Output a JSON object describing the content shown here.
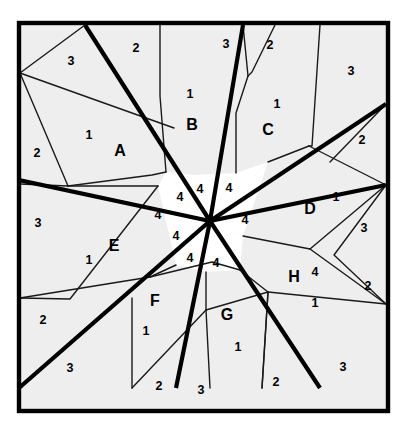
{
  "figure": {
    "frame": {
      "x": 19,
      "y": 23,
      "width": 369,
      "height": 388
    },
    "center": {
      "x": 210,
      "y": 221
    },
    "colors": {
      "shaded_region": "#eeeeee",
      "white_region": "#ffffff",
      "thin_stroke": "#1a1a1a",
      "thick_stroke": "#000000",
      "background": "#ffffff",
      "label_text": "#000000"
    }
  },
  "region_labels": [
    {
      "id": "A",
      "text": "A",
      "x": 120,
      "y": 150
    },
    {
      "id": "B",
      "text": "B",
      "x": 192,
      "y": 124
    },
    {
      "id": "C",
      "text": "C",
      "x": 268,
      "y": 129
    },
    {
      "id": "D",
      "text": "D",
      "x": 310,
      "y": 208
    },
    {
      "id": "E",
      "text": "E",
      "x": 114,
      "y": 245
    },
    {
      "id": "F",
      "text": "F",
      "x": 155,
      "y": 300
    },
    {
      "id": "G",
      "text": "G",
      "x": 227,
      "y": 314
    },
    {
      "id": "H",
      "text": "H",
      "x": 294,
      "y": 276
    }
  ],
  "number_labels": [
    {
      "text": "3",
      "x": 71,
      "y": 61
    },
    {
      "text": "2",
      "x": 136,
      "y": 48
    },
    {
      "text": "3",
      "x": 226,
      "y": 44
    },
    {
      "text": "2",
      "x": 270,
      "y": 45
    },
    {
      "text": "3",
      "x": 351,
      "y": 71
    },
    {
      "text": "1",
      "x": 190,
      "y": 94
    },
    {
      "text": "1",
      "x": 277,
      "y": 104
    },
    {
      "text": "1",
      "x": 89,
      "y": 135
    },
    {
      "text": "2",
      "x": 37,
      "y": 153
    },
    {
      "text": "2",
      "x": 362,
      "y": 140
    },
    {
      "text": "3",
      "x": 38,
      "y": 223
    },
    {
      "text": "1",
      "x": 336,
      "y": 197
    },
    {
      "text": "3",
      "x": 364,
      "y": 228
    },
    {
      "text": "1",
      "x": 89,
      "y": 260
    },
    {
      "text": "4",
      "x": 315,
      "y": 272
    },
    {
      "text": "2",
      "x": 368,
      "y": 286
    },
    {
      "text": "1",
      "x": 315,
      "y": 303
    },
    {
      "text": "2",
      "x": 43,
      "y": 320
    },
    {
      "text": "1",
      "x": 146,
      "y": 331
    },
    {
      "text": "1",
      "x": 238,
      "y": 347
    },
    {
      "text": "3",
      "x": 70,
      "y": 368
    },
    {
      "text": "2",
      "x": 159,
      "y": 386
    },
    {
      "text": "3",
      "x": 201,
      "y": 390
    },
    {
      "text": "2",
      "x": 276,
      "y": 382
    },
    {
      "text": "3",
      "x": 343,
      "y": 367
    },
    {
      "text": "4",
      "x": 180,
      "y": 197
    },
    {
      "text": "4",
      "x": 200,
      "y": 189
    },
    {
      "text": "4",
      "x": 229,
      "y": 188
    },
    {
      "text": "4",
      "x": 245,
      "y": 220
    },
    {
      "text": "4",
      "x": 176,
      "y": 236
    },
    {
      "text": "4",
      "x": 190,
      "y": 258
    },
    {
      "text": "4",
      "x": 216,
      "y": 263
    },
    {
      "text": "4",
      "x": 158,
      "y": 215
    }
  ],
  "shaded_regions": [
    {
      "name": "top-left-corner-3",
      "points": "21,25 85,25 20,73"
    },
    {
      "name": "region-A-outer-1",
      "points": "20,73 174,128 152,175 68,186"
    },
    {
      "name": "region-A-left-2",
      "points": "20,73 68,186 20,184"
    },
    {
      "name": "region-B",
      "points": "160,25 243,25 236,113 194,175 166,172"
    },
    {
      "name": "top-2-strip",
      "points": "85,25 160,25 160,96"
    },
    {
      "name": "top-3-wedge",
      "points": "243,25 275,25 248,76"
    },
    {
      "name": "region-C",
      "points": "248,76 300,25 320,25 309,146 268,162"
    },
    {
      "name": "region-C-top-2",
      "points": "275,25 300,25 252,72"
    },
    {
      "name": "top-right-3",
      "points": "320,25 386,25 386,104 312,146"
    },
    {
      "name": "region-D",
      "points": "309,146 386,104 386,185 310,249 243,236"
    },
    {
      "name": "right-2",
      "points": "386,104 386,185 330,162"
    },
    {
      "name": "region-E",
      "points": "20,184 68,186 158,186 188,242 150,277 70,299"
    },
    {
      "name": "left-3",
      "points": "20,184 70,299 20,298"
    },
    {
      "name": "left-2-lower",
      "points": "20,298 70,299 20,388"
    },
    {
      "name": "bottom-left-3",
      "points": "20,388 75,388 132,388 132,330"
    },
    {
      "name": "region-F",
      "points": "150,277 212,262 206,310 176,388 132,388 132,298"
    },
    {
      "name": "bottom-2",
      "points": "132,330 132,388 176,388"
    },
    {
      "name": "region-G",
      "points": "206,310 240,270 268,292 262,388 210,388"
    },
    {
      "name": "bottom-3-g",
      "points": "176,388 210,388 203,310"
    },
    {
      "name": "region-H",
      "points": "268,292 310,249 386,304 320,388 262,388"
    },
    {
      "name": "bottom-right-3",
      "points": "262,388 320,388 386,388 386,304"
    },
    {
      "name": "right-2-lower",
      "points": "386,185 386,304 334,255"
    }
  ]
}
